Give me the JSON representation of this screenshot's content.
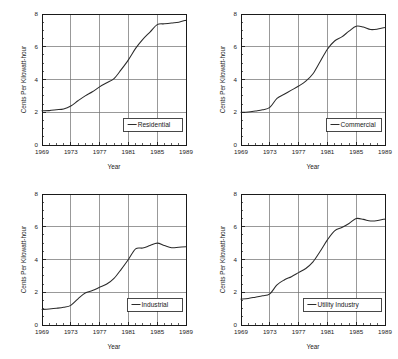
{
  "figure": {
    "name": "average-electricity-price-small-multiples",
    "panel_count": 4
  },
  "axes": {
    "xlabel": "Year",
    "ylabel": "Cents Per Kilowatt-hour",
    "x_ticks": [
      "1969",
      "1973",
      "1977",
      "1981",
      "1985",
      "1989"
    ],
    "y_ticks": [
      "0",
      "2",
      "4",
      "6",
      "8"
    ]
  },
  "colors": {
    "line": "#2b2b2b",
    "grid": "#6e6e6e",
    "axis": "#1a1a1a",
    "background": "#ffffff"
  },
  "chart_data": [
    {
      "type": "line",
      "title": "",
      "xlabel": "Year",
      "ylabel": "Cents Per Kilowatt-hour",
      "xlim": [
        1969,
        1989
      ],
      "ylim": [
        0,
        8
      ],
      "grid": true,
      "legend": "Residential",
      "legend_position": "lower-right",
      "xticks": [
        1969,
        1973,
        1977,
        1981,
        1985,
        1989
      ],
      "yticks": [
        0,
        2,
        4,
        6,
        8
      ],
      "x": [
        1969,
        1970,
        1971,
        1972,
        1973,
        1974,
        1975,
        1976,
        1977,
        1978,
        1979,
        1980,
        1981,
        1982,
        1983,
        1984,
        1985,
        1986,
        1987,
        1988,
        1989
      ],
      "series": [
        {
          "name": "Residential",
          "values": [
            2.09,
            2.1,
            2.15,
            2.2,
            2.38,
            2.7,
            3.0,
            3.25,
            3.55,
            3.8,
            4.05,
            4.6,
            5.2,
            5.9,
            6.45,
            6.9,
            7.35,
            7.4,
            7.45,
            7.5,
            7.62
          ]
        }
      ]
    },
    {
      "type": "line",
      "title": "",
      "xlabel": "Year",
      "ylabel": "Cents Per Kilowatt-hour",
      "xlim": [
        1969,
        1989
      ],
      "ylim": [
        0,
        8
      ],
      "grid": true,
      "legend": "Commercial",
      "legend_position": "lower-right",
      "xticks": [
        1969,
        1973,
        1977,
        1981,
        1985,
        1989
      ],
      "yticks": [
        0,
        2,
        4,
        6,
        8
      ],
      "x": [
        1969,
        1970,
        1971,
        1972,
        1973,
        1974,
        1975,
        1976,
        1977,
        1978,
        1979,
        1980,
        1981,
        1982,
        1983,
        1984,
        1985,
        1986,
        1987,
        1988,
        1989
      ],
      "series": [
        {
          "name": "Commercial",
          "values": [
            2.0,
            2.02,
            2.08,
            2.15,
            2.3,
            2.85,
            3.1,
            3.35,
            3.6,
            3.9,
            4.35,
            5.1,
            5.85,
            6.35,
            6.6,
            6.95,
            7.25,
            7.2,
            7.05,
            7.08,
            7.18
          ]
        }
      ]
    },
    {
      "type": "line",
      "title": "",
      "xlabel": "Year",
      "ylabel": "Cents Per Kilowatt-hour",
      "xlim": [
        1969,
        1989
      ],
      "ylim": [
        0,
        8
      ],
      "grid": true,
      "legend": "Industrial",
      "legend_position": "lower-right",
      "xticks": [
        1969,
        1973,
        1977,
        1981,
        1985,
        1989
      ],
      "yticks": [
        0,
        2,
        4,
        6,
        8
      ],
      "x": [
        1969,
        1970,
        1971,
        1972,
        1973,
        1974,
        1975,
        1976,
        1977,
        1978,
        1979,
        1980,
        1981,
        1982,
        1983,
        1984,
        1985,
        1986,
        1987,
        1988,
        1989
      ],
      "series": [
        {
          "name": "Industrial",
          "values": [
            0.95,
            0.98,
            1.02,
            1.08,
            1.2,
            1.6,
            1.95,
            2.1,
            2.3,
            2.5,
            2.85,
            3.4,
            4.0,
            4.65,
            4.7,
            4.85,
            5.0,
            4.85,
            4.72,
            4.75,
            4.78
          ]
        }
      ]
    },
    {
      "type": "line",
      "title": "",
      "xlabel": "Year",
      "ylabel": "Cents Per Kilowatt-hour",
      "xlim": [
        1969,
        1989
      ],
      "ylim": [
        0,
        8
      ],
      "grid": true,
      "legend": "Utility Industry",
      "legend_position": "lower-right",
      "xticks": [
        1969,
        1973,
        1977,
        1981,
        1985,
        1989
      ],
      "yticks": [
        0,
        2,
        4,
        6,
        8
      ],
      "x": [
        1969,
        1970,
        1971,
        1972,
        1973,
        1974,
        1975,
        1976,
        1977,
        1978,
        1979,
        1980,
        1981,
        1982,
        1983,
        1984,
        1985,
        1986,
        1987,
        1988,
        1989
      ],
      "series": [
        {
          "name": "Utility Industry",
          "values": [
            1.58,
            1.62,
            1.7,
            1.78,
            1.9,
            2.45,
            2.75,
            2.95,
            3.2,
            3.45,
            3.85,
            4.5,
            5.2,
            5.75,
            5.95,
            6.2,
            6.5,
            6.45,
            6.35,
            6.38,
            6.48
          ]
        }
      ]
    }
  ]
}
